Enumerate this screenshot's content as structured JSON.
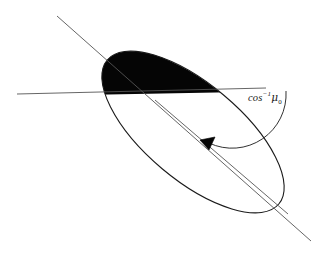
{
  "figure": {
    "background_color": "#ffffff",
    "stroke_color": "#1a1a1a",
    "fill_color": "#050505",
    "width": 324,
    "height": 253
  },
  "labels": {
    "angle": {
      "function": "cos",
      "exponent": "−1",
      "variable": "μ",
      "subscript": "0",
      "full_text": "cos⁻¹μ₀"
    }
  },
  "caption": {
    "clipped_text": ""
  },
  "geometry": {
    "ellipse": {
      "center_x": 193,
      "center_y": 132,
      "semi_major": 112,
      "semi_minor": 48,
      "rotation_deg": 40,
      "stroke_width": 1.1
    },
    "chord_line": {
      "x1": 17,
      "y1": 94,
      "x2": 266,
      "y2": 88,
      "stroke_width": 0.9
    },
    "axis_line": {
      "x1": 57,
      "y1": 16,
      "x2": 311,
      "y2": 241,
      "stroke_width": 0.9
    },
    "inner_radius_line": {
      "x1": 155,
      "y1": 100,
      "x2": 288,
      "y2": 214,
      "stroke_width": 0.9
    },
    "angle_arc": {
      "cx": 232,
      "cy": 89,
      "radius": 54,
      "start_deg": 2,
      "end_deg": 63,
      "stroke_width": 0.9
    },
    "arrowhead": {
      "x": 208,
      "y": 142,
      "size": 8,
      "angle_deg": 205
    },
    "shaded_cap": {
      "description": "black filled region between upper ellipse arc and horizontal chord"
    }
  }
}
